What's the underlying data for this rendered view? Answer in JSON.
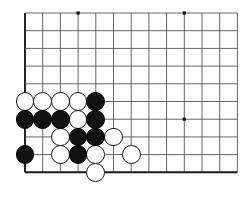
{
  "app": {
    "title": "Go Board Diagram",
    "description": "Go game position, lower-left corner of a 19x19 board"
  },
  "board": {
    "background_color": "#ffffff",
    "line_color": "#555555",
    "edge_line_color": "#1a1a1a",
    "star_point_color": "#111111",
    "black_stone_color": "#121212",
    "white_stone_color": "#ffffff",
    "white_stone_border_color": "#1a1a1a",
    "origin_x": 25,
    "origin_y": 13,
    "cell_size": 17.7,
    "columns": 13,
    "rows": 10,
    "edge_left": true,
    "edge_bottom": true,
    "edge_top": false,
    "edge_right": false,
    "stone_radius": 9.4,
    "star_points": [
      {
        "col": 3,
        "row": 0
      },
      {
        "col": 9,
        "row": 0
      },
      {
        "col": 9,
        "row": 6
      }
    ]
  },
  "stones": [
    {
      "color": "white",
      "col": 0,
      "row": 5,
      "label": "white-stone"
    },
    {
      "color": "white",
      "col": 1,
      "row": 5,
      "label": "white-stone"
    },
    {
      "color": "white",
      "col": 2,
      "row": 5,
      "label": "white-stone"
    },
    {
      "color": "white",
      "col": 3,
      "row": 5,
      "label": "white-stone"
    },
    {
      "color": "black",
      "col": 4,
      "row": 5,
      "label": "black-stone"
    },
    {
      "color": "black",
      "col": 0,
      "row": 6,
      "label": "black-stone"
    },
    {
      "color": "black",
      "col": 1,
      "row": 6,
      "label": "black-stone"
    },
    {
      "color": "black",
      "col": 2,
      "row": 6,
      "label": "black-stone"
    },
    {
      "color": "white",
      "col": 3,
      "row": 6,
      "label": "white-stone"
    },
    {
      "color": "black",
      "col": 4,
      "row": 6,
      "label": "black-stone"
    },
    {
      "color": "white",
      "col": 2,
      "row": 7,
      "label": "white-stone"
    },
    {
      "color": "black",
      "col": 3,
      "row": 7,
      "label": "black-stone"
    },
    {
      "color": "black",
      "col": 4,
      "row": 7,
      "label": "black-stone"
    },
    {
      "color": "white",
      "col": 5,
      "row": 7,
      "label": "white-stone"
    },
    {
      "color": "black",
      "col": 0,
      "row": 8,
      "label": "black-stone"
    },
    {
      "color": "white",
      "col": 2,
      "row": 8,
      "label": "white-stone"
    },
    {
      "color": "black",
      "col": 3,
      "row": 8,
      "label": "black-stone"
    },
    {
      "color": "white",
      "col": 4,
      "row": 8,
      "label": "white-stone"
    },
    {
      "color": "white",
      "col": 6,
      "row": 8,
      "label": "white-stone"
    },
    {
      "color": "white",
      "col": 4,
      "row": 9,
      "label": "white-stone"
    }
  ]
}
